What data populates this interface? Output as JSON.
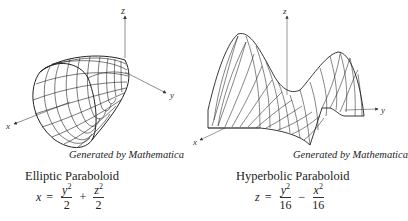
{
  "figures": [
    {
      "caption": "Generated by Mathematica",
      "title": "Elliptic Paraboloid",
      "equation": {
        "lhs": "x",
        "eq": "=",
        "t1_num_var": "y",
        "t1_num_exp": "2",
        "t1_den": "2",
        "op": "+",
        "t2_num_var": "z",
        "t2_num_exp": "2",
        "t2_den": "2"
      },
      "axes": {
        "x": "x",
        "y": "y",
        "z": "z"
      }
    },
    {
      "caption": "Generated by Mathematica",
      "title": "Hyperbolic Paraboloid",
      "equation": {
        "lhs": "z",
        "eq": "=",
        "t1_num_var": "y",
        "t1_num_exp": "2",
        "t1_den": "16",
        "op": "−",
        "t2_num_var": "x",
        "t2_num_exp": "2",
        "t2_den": "16"
      },
      "axes": {
        "x": "x",
        "y": "y",
        "z": "z"
      }
    }
  ]
}
